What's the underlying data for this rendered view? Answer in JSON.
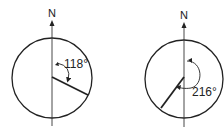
{
  "diagrams": [
    {
      "north_label": "N",
      "angle_label": "118°",
      "bearing_deg": 118
    },
    {
      "north_label": "N",
      "angle_label": "216°",
      "bearing_deg": 216
    }
  ]
}
